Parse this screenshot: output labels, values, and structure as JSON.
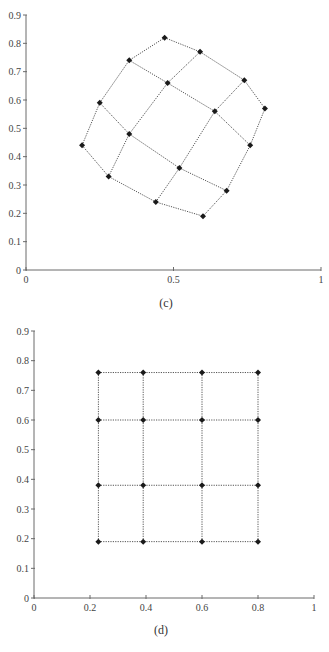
{
  "chart_data": [
    {
      "type": "scatter",
      "title": "(c)",
      "caption": "(c)",
      "xlabel": "",
      "ylabel": "",
      "xlim": [
        0,
        1
      ],
      "ylim": [
        0,
        0.9
      ],
      "x_ticks": [
        0,
        0.5,
        1
      ],
      "x_tick_labels": [
        "0",
        "0.5",
        "1"
      ],
      "y_ticks": [
        0,
        0.1,
        0.2,
        0.3,
        0.4,
        0.5,
        0.6,
        0.7,
        0.8,
        0.9
      ],
      "y_tick_labels": [
        "0",
        "0.1",
        "0.2",
        "0.3",
        "0.4",
        "0.5",
        "0.6",
        "0.7",
        "0.8",
        "0.9"
      ],
      "grid": false,
      "description": "Distorted 4x4 mesh of points connected by dotted lines",
      "mesh_rows": [
        [
          [
            0.19,
            0.44
          ],
          [
            0.25,
            0.59
          ],
          [
            0.35,
            0.74
          ],
          [
            0.47,
            0.82
          ]
        ],
        [
          [
            0.28,
            0.33
          ],
          [
            0.35,
            0.48
          ],
          [
            0.48,
            0.66
          ],
          [
            0.59,
            0.77
          ]
        ],
        [
          [
            0.44,
            0.24
          ],
          [
            0.52,
            0.36
          ],
          [
            0.64,
            0.56
          ],
          [
            0.74,
            0.67
          ]
        ],
        [
          [
            0.6,
            0.19
          ],
          [
            0.68,
            0.28
          ],
          [
            0.76,
            0.44
          ],
          [
            0.81,
            0.57
          ]
        ]
      ],
      "layout": {
        "left": 26,
        "right": 321,
        "top": 15,
        "bottom": 270,
        "caption_x": 166,
        "caption_y": 307
      }
    },
    {
      "type": "scatter",
      "title": "(d)",
      "caption": "(d)",
      "xlabel": "",
      "ylabel": "",
      "xlim": [
        0,
        1
      ],
      "ylim": [
        0,
        0.9
      ],
      "x_ticks": [
        0,
        0.2,
        0.4,
        0.6,
        0.8,
        1
      ],
      "x_tick_labels": [
        "0",
        "0.2",
        "0.4",
        "0.6",
        "0.8",
        "1"
      ],
      "y_ticks": [
        0,
        0.1,
        0.2,
        0.3,
        0.4,
        0.5,
        0.6,
        0.7,
        0.8,
        0.9
      ],
      "y_tick_labels": [
        "0",
        "0.1",
        "0.2",
        "0.3",
        "0.4",
        "0.5",
        "0.6",
        "0.7",
        "0.8",
        "0.9"
      ],
      "grid": false,
      "description": "Regular rectilinear 4x4 mesh of points connected by dotted lines",
      "mesh_rows": [
        [
          [
            0.23,
            0.76
          ],
          [
            0.39,
            0.76
          ],
          [
            0.6,
            0.76
          ],
          [
            0.8,
            0.76
          ]
        ],
        [
          [
            0.23,
            0.6
          ],
          [
            0.39,
            0.6
          ],
          [
            0.6,
            0.6
          ],
          [
            0.8,
            0.6
          ]
        ],
        [
          [
            0.23,
            0.38
          ],
          [
            0.39,
            0.38
          ],
          [
            0.6,
            0.38
          ],
          [
            0.8,
            0.38
          ]
        ],
        [
          [
            0.23,
            0.19
          ],
          [
            0.39,
            0.19
          ],
          [
            0.6,
            0.19
          ],
          [
            0.8,
            0.19
          ]
        ]
      ],
      "layout": {
        "left": 34,
        "right": 314,
        "top": 331,
        "bottom": 598,
        "caption_x": 161,
        "caption_y": 634
      }
    }
  ],
  "colors": {
    "axis": "#6a6a6a",
    "mesh_line": "#555555",
    "marker": "#1a1a1a",
    "text": "#444444"
  }
}
